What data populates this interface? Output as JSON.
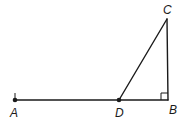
{
  "diagram": {
    "type": "geometry",
    "colors": {
      "stroke": "#1a1a1a",
      "background": "#ffffff"
    },
    "points": {
      "A": {
        "label": "A",
        "x": 15,
        "y": 100,
        "marked": true
      },
      "D": {
        "label": "D",
        "x": 119,
        "y": 100,
        "marked": true
      },
      "B": {
        "label": "B",
        "x": 168,
        "y": 100,
        "marked": false
      },
      "C": {
        "label": "C",
        "x": 167,
        "y": 19,
        "marked": false
      }
    },
    "segments": [
      {
        "from": "A",
        "to": "B"
      },
      {
        "from": "D",
        "to": "C"
      },
      {
        "from": "C",
        "to": "B"
      }
    ],
    "right_angle_at": "B",
    "labels": {
      "A": "A",
      "B": "B",
      "C": "C",
      "D": "D"
    }
  }
}
